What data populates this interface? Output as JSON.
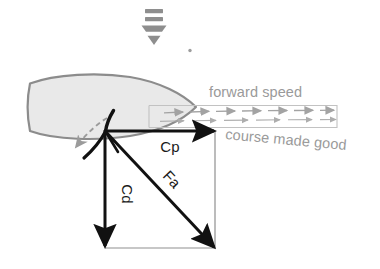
{
  "diagram": {
    "background_color": "#ffffff",
    "colors": {
      "vector_black": "#111111",
      "hull_outline": "#8c8c8c",
      "hull_fill": "#e8e8e8",
      "flow_gray": "#a0a0a0",
      "label_gray": "#9a9a9a",
      "frame_gray": "#b8b8b8",
      "wind_gray": "#8a8a8a"
    },
    "labels": {
      "cp": "Cp",
      "cd": "Cd",
      "fa": "Fa",
      "forward_speed": "forward speed",
      "course_made_good": "course made good"
    },
    "icons": {
      "wind_arrow": "wind-direction-down-arrow-icon",
      "hull": "boat-hull-icon",
      "sail": "sail-icon",
      "keel": "keel-icon",
      "rudder_swing": "rudder-swing-dashed-arrow-icon",
      "speed_flow": "flow-arrow-chain-icon",
      "dot": "small-dot-marker"
    },
    "vectors": [
      {
        "name": "Cp",
        "label": "Cp",
        "direction": "right",
        "from": [
          105,
          131
        ],
        "to": [
          215,
          131
        ]
      },
      {
        "name": "Cd",
        "label": "Cd",
        "direction": "down",
        "from": [
          105,
          131
        ],
        "to": [
          105,
          248
        ]
      },
      {
        "name": "Fa",
        "label": "Fa",
        "direction": "down-right",
        "from": [
          105,
          131
        ],
        "to": [
          215,
          248
        ]
      }
    ],
    "wind": {
      "direction": "down",
      "position": [
        153,
        10
      ]
    }
  }
}
